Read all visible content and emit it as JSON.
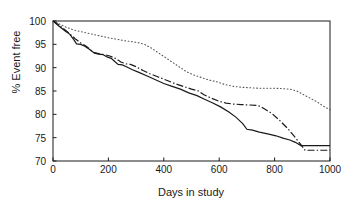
{
  "chart_data": {
    "type": "line",
    "title": "",
    "subtitle": "",
    "xlabel": "Days in study",
    "ylabel": "% Event free",
    "xlim": [
      0,
      1000
    ],
    "ylim": [
      70,
      100
    ],
    "xticks": [
      0,
      200,
      400,
      600,
      800,
      1000
    ],
    "yticks": [
      70,
      75,
      80,
      85,
      90,
      95,
      100
    ],
    "grid": false,
    "legend": "none",
    "annotations": [],
    "series": [
      {
        "name": "solid-curve",
        "style": "solid",
        "color": "#1a1a1a",
        "x": [
          0,
          20,
          45,
          60,
          75,
          85,
          100,
          115,
          130,
          150,
          165,
          180,
          195,
          210,
          225,
          235,
          250,
          265,
          285,
          310,
          340,
          370,
          400,
          430,
          460,
          490,
          520,
          545,
          575,
          605,
          635,
          660,
          685,
          700,
          720,
          745,
          775,
          805,
          830,
          855,
          875,
          895,
          910,
          940,
          1000
        ],
        "y": [
          100.0,
          99.0,
          97.8,
          97.2,
          96.0,
          95.1,
          95.0,
          94.6,
          94.0,
          93.1,
          92.9,
          92.8,
          92.3,
          92.0,
          91.2,
          90.7,
          90.6,
          90.2,
          89.6,
          89.0,
          88.2,
          87.4,
          86.6,
          86.0,
          85.4,
          84.6,
          84.0,
          83.3,
          82.5,
          81.6,
          80.5,
          79.4,
          78.0,
          76.8,
          76.6,
          76.2,
          75.8,
          75.4,
          74.9,
          74.5,
          74.0,
          73.3,
          73.3,
          73.3,
          73.3
        ]
      },
      {
        "name": "dash-dot-curve",
        "style": "dashdot",
        "color": "#1a1a1a",
        "x": [
          0,
          20,
          45,
          60,
          80,
          100,
          120,
          145,
          165,
          185,
          205,
          225,
          245,
          265,
          280,
          300,
          325,
          350,
          380,
          410,
          440,
          470,
          500,
          525,
          545,
          570,
          600,
          625,
          650,
          680,
          710,
          740,
          760,
          790,
          820,
          850,
          875,
          895,
          910,
          950,
          1000
        ],
        "y": [
          100.0,
          99.2,
          98.0,
          97.3,
          96.2,
          95.3,
          94.6,
          93.3,
          93.0,
          92.8,
          92.5,
          92.0,
          91.2,
          90.8,
          90.7,
          90.2,
          89.4,
          88.7,
          88.0,
          87.3,
          86.6,
          86.0,
          85.4,
          85.0,
          84.2,
          83.5,
          82.8,
          82.4,
          82.2,
          82.1,
          82.0,
          81.9,
          81.3,
          80.2,
          78.6,
          76.8,
          75.0,
          73.5,
          72.3,
          72.3,
          72.3
        ]
      },
      {
        "name": "dotted-curve",
        "style": "dotted",
        "color": "#555555",
        "x": [
          0,
          25,
          50,
          80,
          110,
          140,
          170,
          200,
          230,
          255,
          280,
          305,
          330,
          355,
          380,
          405,
          430,
          455,
          480,
          505,
          530,
          560,
          590,
          620,
          650,
          680,
          710,
          740,
          770,
          800,
          830,
          855,
          880,
          905,
          930,
          955,
          980,
          1000
        ],
        "y": [
          100.0,
          99.3,
          98.6,
          98.0,
          97.6,
          97.2,
          96.8,
          96.4,
          96.1,
          95.8,
          95.6,
          95.4,
          95.0,
          94.2,
          93.2,
          92.2,
          91.2,
          90.2,
          89.2,
          88.5,
          88.0,
          87.4,
          87.0,
          86.4,
          86.0,
          85.8,
          85.7,
          85.6,
          85.6,
          85.6,
          85.5,
          85.4,
          85.0,
          84.2,
          83.4,
          82.6,
          81.6,
          81.0
        ]
      }
    ]
  },
  "axes": {
    "xtick_labels": [
      "0",
      "200",
      "400",
      "600",
      "800",
      "1000"
    ],
    "ytick_labels": [
      "70",
      "75",
      "80",
      "85",
      "90",
      "95",
      "100"
    ],
    "xlabel": "Days in study",
    "ylabel": "% Event free"
  },
  "colors": {
    "frame": "#1a1a1a",
    "solid_series": "#1a1a1a",
    "dashdot_series": "#1a1a1a",
    "dotted_series": "#555555",
    "background": "#ffffff"
  }
}
